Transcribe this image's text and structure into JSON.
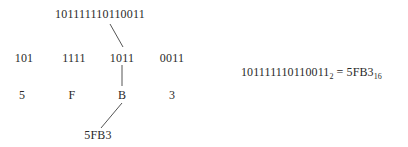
{
  "diagram": {
    "binary_full": "101111110110011",
    "groups": [
      "101",
      "1111",
      "1011",
      "0011"
    ],
    "hex_digits": [
      "5",
      "F",
      "B",
      "3"
    ],
    "hex_result": "5FB3",
    "equation": {
      "binary": "101111110110011",
      "binary_base": "2",
      "equals": "=",
      "hex": "5FB3",
      "hex_base": "16"
    },
    "line_color": "#555555"
  }
}
